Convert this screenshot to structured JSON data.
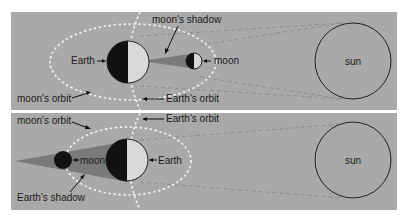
{
  "panels": [
    {
      "id": "solar-eclipse",
      "labels": {
        "earth": "Earth",
        "moon": "moon",
        "sun": "sun",
        "moons_shadow": "moon's shadow",
        "moons_orbit": "moon's orbit",
        "earths_orbit": "Earth's orbit"
      }
    },
    {
      "id": "lunar-eclipse",
      "labels": {
        "earth": "Earth",
        "moon": "moon",
        "sun": "sun",
        "earths_shadow": "Earth's shadow",
        "moons_orbit": "moon's orbit",
        "earths_orbit": "Earth's orbit"
      }
    }
  ],
  "colors": {
    "panel_bg": "#a9a9a9",
    "orbit": "#f2f2f2",
    "rays": "#8e8e8e",
    "shadow": "#7a7a7a",
    "night_side": "#111111",
    "day_side": "#d9d9d9",
    "outline": "#222222"
  }
}
